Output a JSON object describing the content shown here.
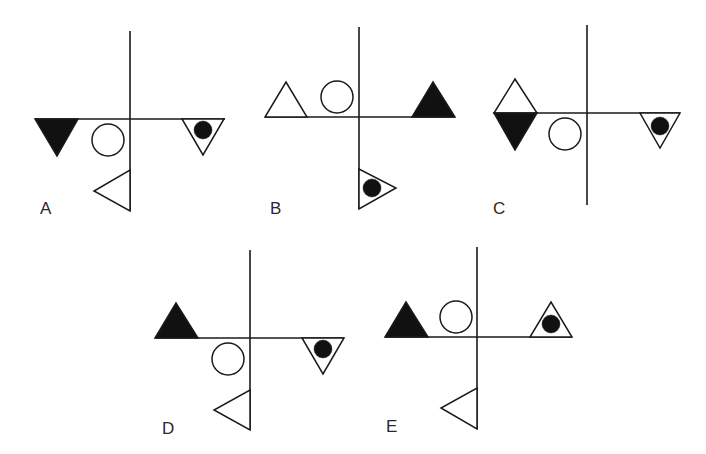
{
  "puzzle": {
    "description": "Five option figures each composed of a cross of two lines and four shapes",
    "colors": {
      "stroke": "#1a1a1a",
      "fill_black": "#111111",
      "fill_white": "#ffffff"
    },
    "options": [
      {
        "label": "A",
        "label_pos": [
          40,
          200
        ],
        "vline": [
          130,
          31,
          130,
          211
        ],
        "hline": [
          35,
          119,
          225,
          119
        ],
        "shapes": [
          {
            "type": "triangle",
            "points": "35,119 78,119 57,156",
            "fill": "black",
            "name": "black-down-triangle"
          },
          {
            "type": "circle",
            "cx": 108,
            "cy": 140,
            "r": 16,
            "fill": "white",
            "name": "hollow-circle"
          },
          {
            "type": "triangle",
            "points": "182,119 224,119 203,155",
            "fill": "white",
            "name": "down-triangle-with-dot"
          },
          {
            "type": "circle",
            "cx": 203,
            "cy": 130,
            "r": 9,
            "fill": "black",
            "name": "black-dot"
          },
          {
            "type": "triangle",
            "points": "130,170 130,211 94,191",
            "fill": "white",
            "name": "left-pointing-triangle"
          }
        ]
      },
      {
        "label": "B",
        "label_pos": [
          270,
          200
        ],
        "vline": [
          359,
          27,
          359,
          209
        ],
        "hline": [
          265,
          117,
          455,
          117
        ],
        "shapes": [
          {
            "type": "triangle",
            "points": "265,117 307,117 286,82",
            "fill": "white",
            "name": "hollow-up-triangle"
          },
          {
            "type": "circle",
            "cx": 337,
            "cy": 97,
            "r": 16,
            "fill": "white",
            "name": "hollow-circle"
          },
          {
            "type": "triangle",
            "points": "412,117 455,117 433,82",
            "fill": "black",
            "name": "black-up-triangle"
          },
          {
            "type": "triangle",
            "points": "359,169 359,209 396,188",
            "fill": "white",
            "name": "right-triangle-with-dot"
          },
          {
            "type": "circle",
            "cx": 372,
            "cy": 188,
            "r": 9,
            "fill": "black",
            "name": "black-dot"
          }
        ]
      },
      {
        "label": "C",
        "label_pos": [
          493,
          200
        ],
        "vline": [
          587,
          25,
          587,
          205
        ],
        "hline": [
          494,
          113,
          680,
          113
        ],
        "shapes": [
          {
            "type": "triangle",
            "points": "494,113 537,113 515,79",
            "fill": "white",
            "name": "hollow-up-triangle"
          },
          {
            "type": "triangle",
            "points": "494,113 537,113 515,150",
            "fill": "black",
            "name": "black-down-triangle"
          },
          {
            "type": "circle",
            "cx": 565,
            "cy": 134,
            "r": 16,
            "fill": "white",
            "name": "hollow-circle"
          },
          {
            "type": "triangle",
            "points": "640,113 680,113 660,148",
            "fill": "white",
            "name": "down-triangle-with-dot"
          },
          {
            "type": "circle",
            "cx": 660,
            "cy": 126,
            "r": 9,
            "fill": "black",
            "name": "black-dot"
          }
        ]
      },
      {
        "label": "D",
        "label_pos": [
          162,
          420
        ],
        "vline": [
          250,
          250,
          250,
          430
        ],
        "hline": [
          155,
          338,
          344,
          338
        ],
        "shapes": [
          {
            "type": "triangle",
            "points": "155,338 198,338 176,303",
            "fill": "black",
            "name": "black-up-triangle"
          },
          {
            "type": "circle",
            "cx": 228,
            "cy": 359,
            "r": 16,
            "fill": "white",
            "name": "hollow-circle"
          },
          {
            "type": "triangle",
            "points": "302,338 344,338 323,374",
            "fill": "white",
            "name": "down-triangle-with-dot"
          },
          {
            "type": "circle",
            "cx": 323,
            "cy": 349,
            "r": 9,
            "fill": "black",
            "name": "black-dot"
          },
          {
            "type": "triangle",
            "points": "250,390 250,430 214,410",
            "fill": "white",
            "name": "left-pointing-triangle"
          }
        ]
      },
      {
        "label": "E",
        "label_pos": [
          386,
          418
        ],
        "vline": [
          477,
          247,
          477,
          429
        ],
        "hline": [
          385,
          337,
          572,
          337
        ],
        "shapes": [
          {
            "type": "triangle",
            "points": "385,337 428,337 406,302",
            "fill": "black",
            "name": "black-up-triangle"
          },
          {
            "type": "circle",
            "cx": 456,
            "cy": 317,
            "r": 16,
            "fill": "white",
            "name": "hollow-circle"
          },
          {
            "type": "triangle",
            "points": "530,337 572,337 551,302",
            "fill": "white",
            "name": "up-triangle-with-dot"
          },
          {
            "type": "circle",
            "cx": 551,
            "cy": 324,
            "r": 9,
            "fill": "black",
            "name": "black-dot"
          },
          {
            "type": "triangle",
            "points": "477,388 477,429 441,408",
            "fill": "white",
            "name": "left-pointing-triangle"
          }
        ]
      }
    ]
  }
}
